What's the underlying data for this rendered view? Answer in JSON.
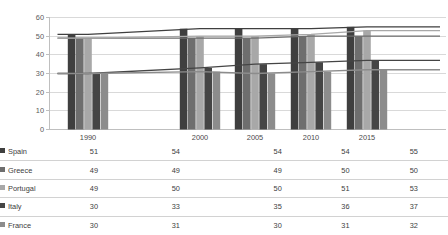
{
  "chart_data": {
    "type": "bar",
    "title": "",
    "subtitle": "",
    "xlabel": "",
    "ylabel": "",
    "categories": [
      "1990",
      "2000",
      "2005",
      "2010",
      "2015"
    ],
    "ylim": [
      0,
      60
    ],
    "yticks": [
      0,
      10,
      20,
      30,
      40,
      50,
      60
    ],
    "grid": true,
    "legend_position": "table-left",
    "has_data_table": true,
    "series": [
      {
        "name": "Spain",
        "values": [
          51,
          54,
          54,
          54,
          55
        ],
        "color": "#3f3f3f",
        "render": "bar+line"
      },
      {
        "name": "Greece",
        "values": [
          49,
          49,
          49,
          50,
          50
        ],
        "color": "#6e6e6e",
        "render": "bar+line"
      },
      {
        "name": "Portugal",
        "values": [
          49,
          50,
          50,
          51,
          53
        ],
        "color": "#a8a8a8",
        "render": "bar+line"
      },
      {
        "name": "Italy",
        "values": [
          30,
          33,
          35,
          36,
          37
        ],
        "color": "#454545",
        "render": "bar+line"
      },
      {
        "name": "France",
        "values": [
          30,
          31,
          30,
          31,
          32
        ],
        "color": "#8c8c8c",
        "render": "bar+line"
      }
    ]
  },
  "table": {
    "corner_label": "",
    "column_headers": [
      "1990",
      "2000",
      "2005",
      "2010",
      "2015"
    ],
    "rows": [
      {
        "name": "Spain",
        "marker": "square-dark",
        "values": [
          "51",
          "54",
          "54",
          "54",
          "55"
        ]
      },
      {
        "name": "Greece",
        "marker": "square-medium-dark",
        "values": [
          "49",
          "49",
          "49",
          "50",
          "50"
        ]
      },
      {
        "name": "Portugal",
        "marker": "square-light",
        "values": [
          "49",
          "50",
          "50",
          "51",
          "53"
        ]
      },
      {
        "name": "Italy",
        "marker": "square-dark2",
        "values": [
          "30",
          "33",
          "35",
          "36",
          "37"
        ]
      },
      {
        "name": "France",
        "marker": "square-medium",
        "values": [
          "30",
          "31",
          "30",
          "31",
          "32"
        ]
      }
    ]
  },
  "axis": {
    "y_tick_labels": [
      "60",
      "50",
      "40",
      "30",
      "20",
      "10",
      "0"
    ]
  },
  "colors": {
    "spain": "#3f3f3f",
    "greece": "#6e6e6e",
    "portugal": "#a8a8a8",
    "italy": "#454545",
    "france": "#8c8c8c",
    "gridline": "#d9d9d9",
    "axis": "#bfbfbf",
    "table_border": "#d2d2d2",
    "text": "#3c3c3c",
    "background": "#ffffff"
  }
}
